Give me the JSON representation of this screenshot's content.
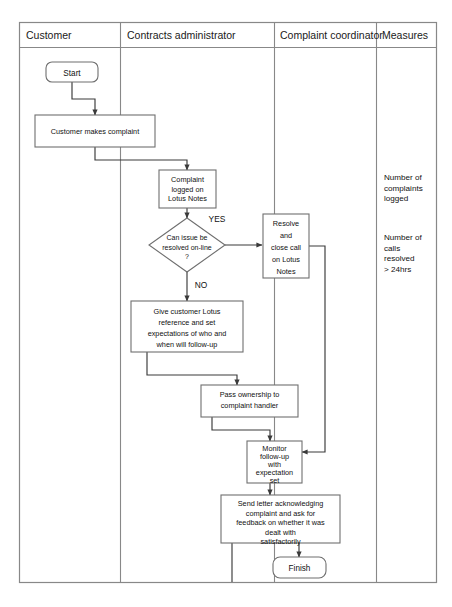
{
  "diagram": {
    "type": "swimlane-flowchart",
    "lanes": [
      {
        "id": "customer",
        "label": "Customer"
      },
      {
        "id": "contracts-administrator",
        "label": "Contracts administrator"
      },
      {
        "id": "complaint-coordinator",
        "label": "Complaint coordinator"
      },
      {
        "id": "measures",
        "label": "Measures"
      }
    ],
    "nodes": [
      {
        "id": "start",
        "shape": "terminator",
        "lane": "customer",
        "text": "Start",
        "lines": [
          "Start"
        ]
      },
      {
        "id": "customer-makes-complaint",
        "shape": "process",
        "lane": "customer",
        "text": "Customer makes complaint",
        "lines": [
          "Customer makes complaint"
        ]
      },
      {
        "id": "complaint-logged",
        "shape": "process",
        "lane": "contracts-administrator",
        "text": "Complaint logged on Lotus Notes",
        "lines": [
          "Complaint",
          "logged on",
          "Lotus Notes"
        ]
      },
      {
        "id": "can-issue-be-resolved",
        "shape": "decision",
        "lane": "contracts-administrator",
        "text": "Can issue be resolved on-line ?",
        "lines": [
          "Can issue be",
          "resolved on-line",
          "?"
        ]
      },
      {
        "id": "resolve-and-close-call",
        "shape": "process",
        "lane": "complaint-coordinator",
        "text": "Resolve and close call on Lotus Notes",
        "lines": [
          "Resolve",
          "and",
          "close call",
          "on Lotus",
          "Notes"
        ]
      },
      {
        "id": "give-customer-reference",
        "shape": "process",
        "lane": "contracts-administrator",
        "text": "Give customer Lotus reference and set expectations of who and when will follow-up",
        "lines": [
          "Give customer Lotus",
          "reference and set",
          "expectations of who and",
          "when will follow-up"
        ]
      },
      {
        "id": "pass-ownership",
        "shape": "process",
        "lane": "contracts-administrator",
        "text": "Pass ownership to complaint handler",
        "lines": [
          "Pass ownership to",
          "complaint handler"
        ]
      },
      {
        "id": "monitor-follow-up",
        "shape": "process",
        "lane": "complaint-coordinator",
        "text": "Monitor follow-up with expectation set",
        "lines": [
          "Monitor",
          "follow-up",
          "with",
          "expectation",
          "set"
        ]
      },
      {
        "id": "send-letter",
        "shape": "process",
        "lane": "complaint-coordinator",
        "text": "Send letter acknowledging complaint and ask for feedback on whether it was dealt with satisfactorily",
        "lines": [
          "Send letter acknowledging",
          "complaint and ask for",
          "feedback on whether it was",
          "dealt with",
          "satisfactorily"
        ]
      },
      {
        "id": "finish",
        "shape": "terminator",
        "lane": "complaint-coordinator",
        "text": "Finish",
        "lines": [
          "Finish"
        ]
      }
    ],
    "branch_labels": [
      {
        "id": "yes",
        "text": "YES",
        "from": "can-issue-be-resolved",
        "to": "resolve-and-close-call"
      },
      {
        "id": "no",
        "text": "NO",
        "from": "can-issue-be-resolved",
        "to": "give-customer-reference"
      }
    ],
    "measures": [
      {
        "id": "measure-complaints-logged",
        "text": "Number of complaints logged",
        "lines": [
          "Number of",
          "complaints",
          "logged"
        ]
      },
      {
        "id": "measure-calls-resolved",
        "text": "Number of calls resolved > 24hrs",
        "lines": [
          "Number of",
          "calls",
          "resolved",
          "> 24hrs"
        ]
      }
    ],
    "colors": {
      "background": "#ffffff",
      "frame": "#888888",
      "node_stroke": "#6f6f6f",
      "connector": "#3a3a3a",
      "text": "#111111"
    }
  }
}
